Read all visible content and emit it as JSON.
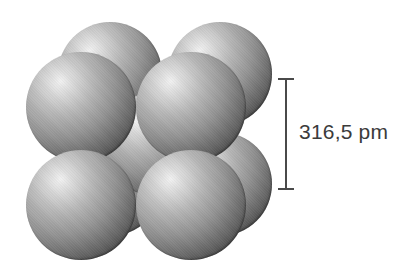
{
  "figure": {
    "kind": "bcc-unit-cell-space-filling-model",
    "background_color": "#ffffff",
    "atom_colors": {
      "highlight": "#f2f2f2",
      "midtone": "#939393",
      "shadow": "#232323"
    }
  },
  "cluster": {
    "atom_count": 9,
    "atoms": [
      {
        "name": "back-top-left"
      },
      {
        "name": "back-top-right"
      },
      {
        "name": "back-bottom-left"
      },
      {
        "name": "back-bottom-right"
      },
      {
        "name": "body-center"
      },
      {
        "name": "front-top-left"
      },
      {
        "name": "front-top-right"
      },
      {
        "name": "front-bottom-left"
      },
      {
        "name": "front-bottom-right"
      }
    ]
  },
  "dimension": {
    "label": "316,5 pm",
    "value": "316,5",
    "unit": "pm",
    "line_color": "#4a4a4a",
    "text_color": "#3b3b3b"
  }
}
